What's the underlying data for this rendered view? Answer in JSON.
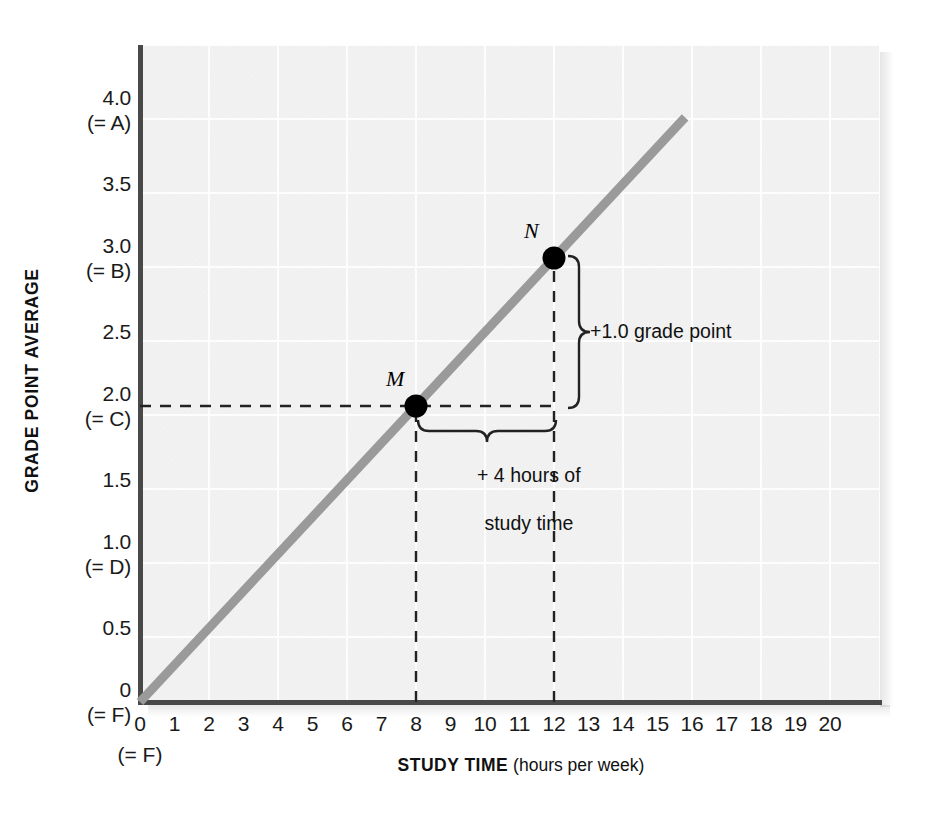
{
  "chart_data": {
    "type": "line",
    "title": "",
    "xlabel_bold": "STUDY TIME",
    "xlabel_unit": "(hours per week)",
    "ylabel": "GRADE POINT AVERAGE",
    "xlim": [
      0,
      20
    ],
    "ylim": [
      0,
      4.0
    ],
    "grid": true,
    "legend": "none",
    "x_ticks": [
      "0",
      "1",
      "2",
      "3",
      "4",
      "5",
      "6",
      "7",
      "8",
      "9",
      "10",
      "11",
      "12",
      "13",
      "14",
      "15",
      "16",
      "17",
      "18",
      "19",
      "20"
    ],
    "x_tick_values": [
      0,
      1,
      2,
      3,
      4,
      5,
      6,
      7,
      8,
      9,
      10,
      11,
      12,
      13,
      14,
      15,
      16,
      17,
      18,
      19,
      20
    ],
    "x_origin_sublabel": "(= F)",
    "y_ticks": [
      {
        "value": 4.0,
        "label": "4.0",
        "sublabel": "(= A)"
      },
      {
        "value": 3.5,
        "label": "3.5",
        "sublabel": ""
      },
      {
        "value": 3.0,
        "label": "3.0",
        "sublabel": "(= B)"
      },
      {
        "value": 2.5,
        "label": "2.5",
        "sublabel": ""
      },
      {
        "value": 2.0,
        "label": "2.0",
        "sublabel": "(= C)"
      },
      {
        "value": 1.5,
        "label": "1.5",
        "sublabel": ""
      },
      {
        "value": 1.0,
        "label": "1.0",
        "sublabel": "(= D)"
      },
      {
        "value": 0.5,
        "label": "0.5",
        "sublabel": ""
      },
      {
        "value": 0.0,
        "label": "0",
        "sublabel": "(= F)"
      }
    ],
    "series": [
      {
        "name": "GPA vs study time",
        "type": "line",
        "color": "#9a9a9a",
        "linewidth": 9,
        "x": [
          0,
          15.8
        ],
        "y": [
          0,
          3.95
        ],
        "slope": 0.25,
        "intercept": 0
      }
    ],
    "points": [
      {
        "label": "M",
        "x": 8,
        "y": 2.0,
        "color": "#000000"
      },
      {
        "label": "N",
        "x": 12,
        "y": 3.0,
        "color": "#000000"
      }
    ],
    "annotations": [
      {
        "name": "rise",
        "text": "+1.0 grade point",
        "from": {
          "x": 12,
          "y": 2.0
        },
        "to": {
          "x": 12,
          "y": 3.0
        }
      },
      {
        "name": "run",
        "text_line1": "+ 4 hours of",
        "text_line2": "study time",
        "from": {
          "x": 8,
          "y": 2.0
        },
        "to": {
          "x": 12,
          "y": 2.0
        }
      }
    ],
    "guides": [
      {
        "name": "gpa-2-horizontal",
        "style": "dashed",
        "from": {
          "x": 0,
          "y": 2.0
        },
        "to": {
          "x": 12,
          "y": 2.0
        }
      },
      {
        "name": "study-8-vertical",
        "style": "dashed",
        "from": {
          "x": 8,
          "y": 0
        },
        "to": {
          "x": 8,
          "y": 2.0
        }
      },
      {
        "name": "study-12-vertical",
        "style": "dashed",
        "from": {
          "x": 12,
          "y": 0
        },
        "to": {
          "x": 12,
          "y": 3.0
        }
      }
    ],
    "colors": {
      "panel_bg": "#f2f2f2",
      "grid": "#ffffff",
      "axis": "#494949",
      "line": "#9a9a9a",
      "marker": "#000000",
      "text": "#111111"
    }
  }
}
